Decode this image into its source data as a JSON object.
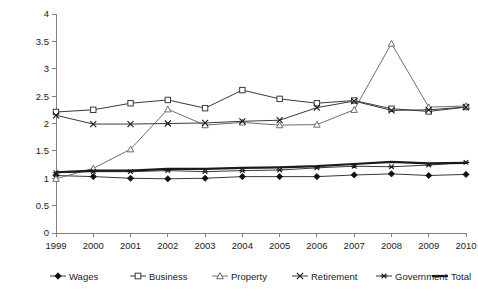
{
  "chart_data": {
    "type": "line",
    "title": "",
    "subtitle": "",
    "xlabel": "",
    "ylabel": "",
    "categories": [
      "1999",
      "2000",
      "2001",
      "2002",
      "2003",
      "2004",
      "2005",
      "2006",
      "2007",
      "2008",
      "2009",
      "2010"
    ],
    "x": [
      1999,
      2000,
      2001,
      2002,
      2003,
      2004,
      2005,
      2006,
      2007,
      2008,
      2009,
      2010
    ],
    "ylim": [
      0,
      4
    ],
    "xlim": [
      1999,
      2010
    ],
    "ytick_labels": [
      "0",
      "0.5",
      "1",
      "1.5",
      "2",
      "2.5",
      "3",
      "3.5",
      "4"
    ],
    "ytick_values": [
      0,
      0.5,
      1,
      1.5,
      2,
      2.5,
      3,
      3.5,
      4
    ],
    "grid": false,
    "legend_position": "bottom",
    "series": [
      {
        "name": "Wages",
        "marker": "filled-diamond",
        "color": "#111111",
        "values": [
          1.05,
          1.03,
          1.0,
          0.99,
          1.0,
          1.03,
          1.03,
          1.03,
          1.06,
          1.08,
          1.05,
          1.07
        ]
      },
      {
        "name": "Business",
        "marker": "open-square",
        "color": "#3a3a3a",
        "values": [
          2.21,
          2.25,
          2.37,
          2.43,
          2.28,
          2.61,
          2.45,
          2.37,
          2.42,
          2.27,
          2.22,
          2.3
        ]
      },
      {
        "name": "Property",
        "marker": "open-triangle",
        "color": "#6e6e6e",
        "values": [
          0.99,
          1.18,
          1.53,
          2.26,
          1.97,
          2.02,
          1.97,
          1.98,
          2.25,
          3.46,
          2.3,
          2.32
        ]
      },
      {
        "name": "Retirement",
        "marker": "x-cross",
        "color": "#1a1a1a",
        "values": [
          2.15,
          1.99,
          1.99,
          2.0,
          2.01,
          2.04,
          2.06,
          2.29,
          2.41,
          2.24,
          2.25,
          2.3
        ]
      },
      {
        "name": "Government",
        "marker": "asterisk",
        "color": "#1a1a1a",
        "values": [
          1.1,
          1.12,
          1.12,
          1.14,
          1.12,
          1.14,
          1.15,
          1.19,
          1.22,
          1.21,
          1.24,
          1.29
        ]
      },
      {
        "name": "Total",
        "marker": "none",
        "color": "#1a1a1a",
        "values": [
          1.11,
          1.14,
          1.14,
          1.17,
          1.17,
          1.19,
          1.2,
          1.22,
          1.26,
          1.3,
          1.27,
          1.28
        ]
      }
    ]
  },
  "legend": {
    "items": [
      {
        "label": "Wages",
        "marker": "filled-diamond"
      },
      {
        "label": "Business",
        "marker": "open-square"
      },
      {
        "label": "Property",
        "marker": "open-triangle"
      },
      {
        "label": "Retirement",
        "marker": "x-cross"
      },
      {
        "label": "Government",
        "marker": "asterisk"
      },
      {
        "label": "Total",
        "marker": "line"
      }
    ]
  }
}
